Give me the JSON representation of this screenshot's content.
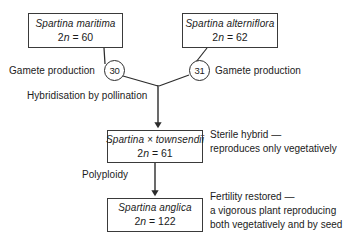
{
  "diagram": {
    "line_color": "#2c2c2c",
    "box_border_color": "#3a3a3a",
    "background": "#ffffff",
    "text_color": "#1b1b1b"
  },
  "boxes": {
    "maritima": {
      "species": "Spartina maritima",
      "chromosome": "2n = 60",
      "chromosome_prefix": "2",
      "chromosome_italic": "n",
      "chromosome_suffix": " = 60"
    },
    "alterniflora": {
      "species": "Spartina alterniflora",
      "chromosome": "2n = 62",
      "chromosome_prefix": "2",
      "chromosome_italic": "n",
      "chromosome_suffix": " = 62"
    },
    "townsendii": {
      "species": "Spartina × townsendii",
      "chromosome": "2n = 61",
      "chromosome_prefix": "2",
      "chromosome_italic": "n",
      "chromosome_suffix": " = 61"
    },
    "anglica": {
      "species": "Spartina anglica",
      "chromosome": "2n = 122",
      "chromosome_prefix": "2",
      "chromosome_italic": "n",
      "chromosome_suffix": " = 122"
    }
  },
  "gamete_nodes": {
    "left": "30",
    "right": "31"
  },
  "process_labels": {
    "gamete_production_left": "Gamete production",
    "gamete_production_right": "Gamete production",
    "hybridisation": "Hybridisation by pollination",
    "polyploidy": "Polyploidy"
  },
  "annotations": {
    "sterile_hybrid": {
      "line1": "Sterile hybrid —",
      "line2": "reproduces only vegetatively"
    },
    "fertility_restored": {
      "line1": "Fertility restored —",
      "line2": "a vigorous plant reproducing",
      "line3": "both vegetatively and by seed"
    }
  }
}
